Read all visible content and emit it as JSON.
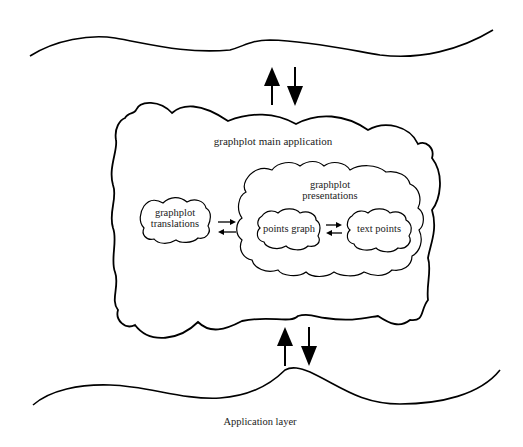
{
  "diagram": {
    "main_application": {
      "label": "graphplot main application"
    },
    "translations": {
      "line1": "graphplot",
      "line2": "translations"
    },
    "presentations": {
      "line1": "graphplot",
      "line2": "presentations"
    },
    "points_graph": {
      "label": "points graph"
    },
    "text_points": {
      "label": "text points"
    },
    "application_layer": {
      "label": "Application layer"
    },
    "colors": {
      "stroke": "#000000",
      "background": "#ffffff",
      "text": "#222222"
    }
  }
}
